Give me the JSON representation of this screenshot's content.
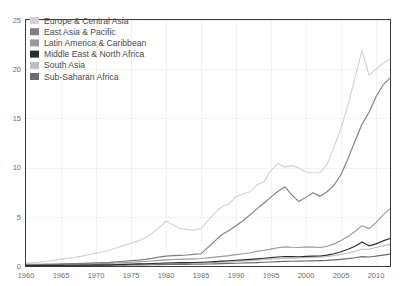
{
  "chart_data": {
    "type": "line",
    "title": "",
    "subtitle": "",
    "xlabel": "",
    "ylabel": "",
    "xlim": [
      1960,
      2012
    ],
    "ylim": [
      0,
      25
    ],
    "grid": true,
    "legend_position": "top-left",
    "y_ticks": [
      "0",
      "5",
      "10",
      "15",
      "20",
      "25"
    ],
    "y_tick_values": [
      0,
      5,
      10,
      15,
      20,
      25
    ],
    "x_ticks": [
      "1960",
      "1965",
      "1970",
      "1975",
      "1980",
      "1985",
      "1990",
      "1995",
      "2000",
      "2005",
      "2010"
    ],
    "x_tick_values": [
      1960,
      1965,
      1970,
      1975,
      1980,
      1985,
      1990,
      1995,
      2000,
      2005,
      2010
    ],
    "x": [
      1960,
      1961,
      1962,
      1963,
      1964,
      1965,
      1966,
      1967,
      1968,
      1969,
      1970,
      1971,
      1972,
      1973,
      1974,
      1975,
      1976,
      1977,
      1978,
      1979,
      1980,
      1981,
      1982,
      1983,
      1984,
      1985,
      1986,
      1987,
      1988,
      1989,
      1990,
      1991,
      1992,
      1993,
      1994,
      1995,
      1996,
      1997,
      1998,
      1999,
      2000,
      2001,
      2002,
      2003,
      2004,
      2005,
      2006,
      2007,
      2008,
      2009,
      2010,
      2011,
      2012
    ],
    "series": [
      {
        "name": "Europe & Central Asia",
        "color": "#d2d2d2",
        "values": [
          0.3,
          0.35,
          0.4,
          0.48,
          0.58,
          0.7,
          0.8,
          0.88,
          1.0,
          1.15,
          1.3,
          1.45,
          1.62,
          1.85,
          2.1,
          2.3,
          2.55,
          2.85,
          3.3,
          3.9,
          4.55,
          4.2,
          3.8,
          3.7,
          3.65,
          3.8,
          4.6,
          5.4,
          6.05,
          6.3,
          7.05,
          7.35,
          7.55,
          8.25,
          8.55,
          9.7,
          10.4,
          10.05,
          10.2,
          9.95,
          9.55,
          9.45,
          9.5,
          10.3,
          12.1,
          14.0,
          16.4,
          19.1,
          21.9,
          19.4,
          20.0,
          20.6,
          21.0
        ]
      },
      {
        "name": "East Asia & Pacific",
        "color": "#808080",
        "values": [
          0.16,
          0.17,
          0.18,
          0.19,
          0.2,
          0.22,
          0.24,
          0.25,
          0.27,
          0.29,
          0.32,
          0.34,
          0.37,
          0.42,
          0.48,
          0.54,
          0.6,
          0.68,
          0.78,
          0.9,
          1.0,
          1.05,
          1.08,
          1.12,
          1.18,
          1.25,
          1.9,
          2.55,
          3.2,
          3.6,
          4.1,
          4.6,
          5.2,
          5.8,
          6.4,
          7.0,
          7.6,
          8.05,
          7.2,
          6.55,
          7.0,
          7.45,
          7.1,
          7.55,
          8.2,
          9.3,
          10.9,
          12.7,
          14.4,
          15.6,
          17.2,
          18.4,
          19.1
        ]
      },
      {
        "name": "Latin America & Caribbean",
        "color": "#9a9a9a",
        "values": [
          0.1,
          0.11,
          0.12,
          0.13,
          0.14,
          0.15,
          0.16,
          0.17,
          0.19,
          0.21,
          0.23,
          0.25,
          0.27,
          0.3,
          0.34,
          0.38,
          0.42,
          0.46,
          0.51,
          0.57,
          0.62,
          0.66,
          0.68,
          0.7,
          0.73,
          0.76,
          0.82,
          0.9,
          0.98,
          1.05,
          1.15,
          1.25,
          1.35,
          1.48,
          1.6,
          1.72,
          1.85,
          1.95,
          1.9,
          1.88,
          1.95,
          1.92,
          1.88,
          2.0,
          2.25,
          2.6,
          3.0,
          3.5,
          4.1,
          3.8,
          4.4,
          5.2,
          5.8
        ]
      },
      {
        "name": "Middle East & North Africa",
        "color": "#2b2b2b",
        "values": [
          0.05,
          0.05,
          0.06,
          0.06,
          0.07,
          0.07,
          0.08,
          0.08,
          0.09,
          0.1,
          0.11,
          0.12,
          0.13,
          0.15,
          0.17,
          0.19,
          0.21,
          0.23,
          0.25,
          0.28,
          0.31,
          0.33,
          0.34,
          0.35,
          0.36,
          0.38,
          0.41,
          0.45,
          0.49,
          0.53,
          0.58,
          0.62,
          0.67,
          0.73,
          0.79,
          0.85,
          0.91,
          0.96,
          0.95,
          0.94,
          0.98,
          1.0,
          1.02,
          1.1,
          1.25,
          1.45,
          1.7,
          2.0,
          2.45,
          2.05,
          2.25,
          2.55,
          2.8
        ]
      },
      {
        "name": "South Asia",
        "color": "#bdbdbd",
        "values": [
          0.04,
          0.04,
          0.05,
          0.05,
          0.06,
          0.06,
          0.07,
          0.07,
          0.08,
          0.08,
          0.09,
          0.1,
          0.11,
          0.12,
          0.13,
          0.15,
          0.16,
          0.18,
          0.2,
          0.22,
          0.24,
          0.25,
          0.26,
          0.27,
          0.28,
          0.3,
          0.33,
          0.36,
          0.39,
          0.42,
          0.46,
          0.5,
          0.54,
          0.59,
          0.64,
          0.69,
          0.74,
          0.79,
          0.8,
          0.82,
          0.86,
          0.88,
          0.9,
          0.96,
          1.06,
          1.18,
          1.32,
          1.5,
          1.7,
          1.72,
          1.88,
          2.05,
          2.2
        ]
      },
      {
        "name": "Sub-Saharan Africa",
        "color": "#6b6b6b",
        "values": [
          0.03,
          0.03,
          0.03,
          0.04,
          0.04,
          0.04,
          0.05,
          0.05,
          0.05,
          0.06,
          0.06,
          0.07,
          0.07,
          0.08,
          0.09,
          0.1,
          0.11,
          0.12,
          0.13,
          0.14,
          0.15,
          0.16,
          0.16,
          0.17,
          0.18,
          0.19,
          0.2,
          0.22,
          0.24,
          0.26,
          0.28,
          0.3,
          0.32,
          0.35,
          0.38,
          0.41,
          0.44,
          0.47,
          0.48,
          0.49,
          0.51,
          0.52,
          0.54,
          0.57,
          0.62,
          0.68,
          0.75,
          0.84,
          0.95,
          0.92,
          1.0,
          1.1,
          1.2
        ]
      }
    ]
  },
  "legend": {
    "entries": [
      {
        "label": "Europe & Central Asia",
        "color": "#d2d2d2"
      },
      {
        "label": "East Asia & Pacific",
        "color": "#808080"
      },
      {
        "label": "Latin America & Caribbean",
        "color": "#9a9a9a"
      },
      {
        "label": "Middle East & North Africa",
        "color": "#2b2b2b"
      },
      {
        "label": "South Asia",
        "color": "#bdbdbd"
      },
      {
        "label": "Sub-Saharan Africa",
        "color": "#6b6b6b"
      }
    ]
  },
  "axes": {
    "frame_color": "#3a3a3a",
    "grid_color": "#ededed",
    "tick_label_color": "#6e6e6e"
  }
}
